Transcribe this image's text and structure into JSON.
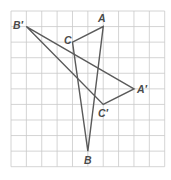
{
  "diagram": {
    "type": "coordinate-grid-transformation",
    "grid": {
      "columns": 10,
      "rows": 10,
      "origin_px": [
        11,
        11
      ],
      "cell_w": 15.37,
      "cell_h": 15.57,
      "line_color": "#c9c9c9"
    },
    "line_color": "#5a5a5a",
    "label_color": "#4a4a4a",
    "triangles": [
      {
        "name": "ABC",
        "vertices": [
          {
            "label": "A",
            "col": 6,
            "row": 1
          },
          {
            "label": "B",
            "col": 5,
            "row": 9
          },
          {
            "label": "C",
            "col": 4,
            "row": 2
          }
        ]
      },
      {
        "name": "A'B'C'",
        "vertices": [
          {
            "label": "A′",
            "col": 8,
            "row": 5
          },
          {
            "label": "B′",
            "col": 1,
            "row": 1
          },
          {
            "label": "C′",
            "col": 6,
            "row": 6
          }
        ]
      }
    ],
    "labels": [
      {
        "text": "A",
        "x": 98,
        "y": 13
      },
      {
        "text": "C",
        "x": 64,
        "y": 35
      },
      {
        "text": "B",
        "x": 84,
        "y": 155
      },
      {
        "text": "B′",
        "x": 13,
        "y": 20
      },
      {
        "text": "A′",
        "x": 137,
        "y": 84
      },
      {
        "text": "C′",
        "x": 98,
        "y": 108
      }
    ]
  }
}
